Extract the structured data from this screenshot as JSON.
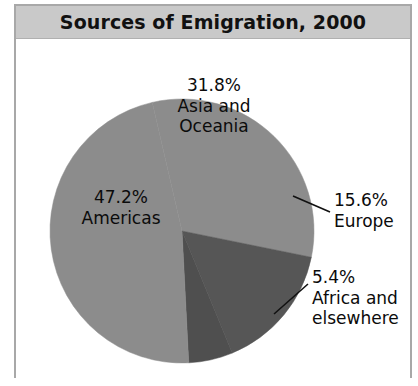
{
  "chart": {
    "title": "Sources of Emigration, 2000",
    "header_bg": "#c9c9c9",
    "frame_border": "#a8a8a8",
    "background": "#ffffff"
  },
  "chart_data": {
    "type": "pie",
    "title": "Sources of Emigration, 2000",
    "xlabel": "",
    "ylabel": "",
    "legend_position": "none",
    "grid": false,
    "start_angle_deg": -13,
    "direction": "clockwise",
    "categories": [
      "Asia and Oceania",
      "Europe",
      "Africa and elsewhere",
      "Americas"
    ],
    "values": [
      31.8,
      15.6,
      5.4,
      47.2
    ],
    "value_suffix": "%",
    "colors": [
      "#8c8c8c",
      "#565656",
      "#4f4f4f",
      "#8c8c8c"
    ],
    "slices": [
      {
        "name": "Asia and Oceania",
        "value": 31.8,
        "percent_label": "31.8%",
        "name_line_1": "Asia and",
        "name_line_2": "Oceania",
        "color": "#8c8c8c",
        "label_placement": "inside"
      },
      {
        "name": "Europe",
        "value": 15.6,
        "percent_label": "15.6%",
        "name_line_1": "Europe",
        "name_line_2": "",
        "color": "#565656",
        "label_placement": "outside-right",
        "has_leader_line": true
      },
      {
        "name": "Africa and elsewhere",
        "value": 5.4,
        "percent_label": "5.4%",
        "name_line_1": "Africa and",
        "name_line_2": "elsewhere",
        "color": "#4f4f4f",
        "label_placement": "outside-right",
        "has_leader_line": true
      },
      {
        "name": "Americas",
        "value": 47.2,
        "percent_label": "47.2%",
        "name_line_1": "Americas",
        "name_line_2": "",
        "color": "#8c8c8c",
        "label_placement": "inside"
      }
    ]
  },
  "labels": {
    "asia": {
      "percent": "31.8%",
      "line1": "Asia and",
      "line2": "Oceania"
    },
    "americas": {
      "percent": "47.2%",
      "line1": "Americas"
    },
    "europe": {
      "percent": "15.6%",
      "line1": "Europe"
    },
    "africa": {
      "percent": "5.4%",
      "line1": "Africa and",
      "line2": "elsewhere"
    }
  }
}
